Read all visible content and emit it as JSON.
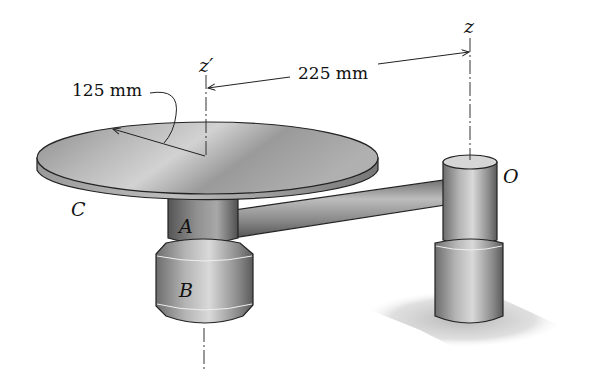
{
  "figure": {
    "dimensions": {
      "disk_radius": "125 mm",
      "axis_offset": "225 mm"
    },
    "axes": {
      "z_prime": "z′",
      "z": "z"
    },
    "labels": {
      "disk": "C",
      "upper_collar": "A",
      "lower_collar": "B",
      "pivot": "O"
    }
  }
}
